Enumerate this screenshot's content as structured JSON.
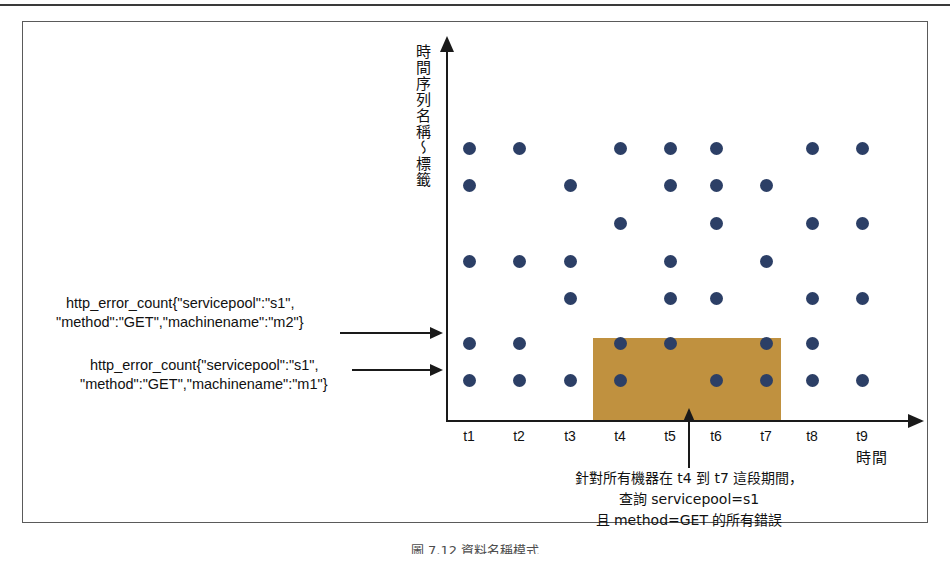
{
  "figure": {
    "caption_bottom": "圖 7.12 資料名稱模式"
  },
  "axes": {
    "y_label": "時間序列名稱～標籤",
    "x_label": "時間",
    "x_ticks": [
      "t1",
      "t2",
      "t3",
      "t4",
      "t5",
      "t6",
      "t7",
      "t8",
      "t9"
    ]
  },
  "annotations": {
    "series_m2_line1": "http_error_count{\"servicepool\":\"s1\",",
    "series_m2_line2": "\"method\":\"GET\",\"machinename\":\"m2\"}",
    "series_m1_line1": "http_error_count{\"servicepool\":\"s1\",",
    "series_m1_line2": "\"method\":\"GET\",\"machinename\":\"m1\"}",
    "query_line1": "針對所有機器在 t4 到 t7 這段期間，",
    "query_line2": "查詢 servicepool=s1",
    "query_line3": "且 method=GET 的所有錯誤"
  },
  "colors": {
    "dot": "#2c3f66",
    "highlight": "#c0913f",
    "axis": "#1a1a1a",
    "frame": "#5a5a5a"
  },
  "chart_data": {
    "type": "scatter",
    "title": "",
    "xlabel": "時間",
    "ylabel": "時間序列名稱～標籤",
    "x": [
      "t1",
      "t2",
      "t3",
      "t4",
      "t5",
      "t6",
      "t7",
      "t8",
      "t9"
    ],
    "rows": [
      {
        "row": 1,
        "present": [
          "t1",
          "t2",
          "t4",
          "t5",
          "t6",
          "t8",
          "t9"
        ]
      },
      {
        "row": 2,
        "present": [
          "t1",
          "t3",
          "t5",
          "t6",
          "t7"
        ]
      },
      {
        "row": 3,
        "present": [
          "t4",
          "t6",
          "t8",
          "t9"
        ]
      },
      {
        "row": 4,
        "present": [
          "t1",
          "t2",
          "t3",
          "t5",
          "t7"
        ]
      },
      {
        "row": 5,
        "present": [
          "t3",
          "t5",
          "t6",
          "t8",
          "t9"
        ]
      },
      {
        "row": 6,
        "present": [
          "t1",
          "t2",
          "t4",
          "t5",
          "t7",
          "t8"
        ],
        "label": "http_error_count{\"servicepool\":\"s1\",\"method\":\"GET\",\"machinename\":\"m2\"}"
      },
      {
        "row": 7,
        "present": [
          "t1",
          "t2",
          "t3",
          "t4",
          "t6",
          "t7",
          "t8",
          "t9"
        ],
        "label": "http_error_count{\"servicepool\":\"s1\",\"method\":\"GET\",\"machinename\":\"m1\"}"
      }
    ],
    "selection": {
      "x_range": [
        "t4",
        "t7"
      ],
      "rows": [
        6,
        7
      ],
      "color": "#c0913f",
      "note": "針對所有機器在 t4 到 t7 這段期間，查詢 servicepool=s1 且 method=GET 的所有錯誤"
    },
    "grid": false,
    "legend": "none"
  },
  "_geom": {
    "col_x": [
      469,
      519,
      570,
      620,
      670,
      716,
      766,
      812,
      862
    ],
    "row_y": [
      148,
      185,
      223,
      261,
      298,
      343,
      380
    ]
  }
}
